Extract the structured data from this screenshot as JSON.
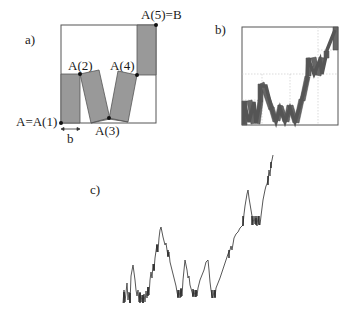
{
  "panels": {
    "a": {
      "tag": "a)",
      "points": {
        "A1": "A=A(1)",
        "A2": "A(2)",
        "A3": "A(3)",
        "A4": "A(4)",
        "A5": "A(5)=B"
      },
      "width_label": "b",
      "rect_fill": "#999999",
      "stroke": "#333333"
    },
    "b": {
      "tag": "b)",
      "rect_fill": "#666666",
      "guide_color": "#bbbbbb"
    },
    "c": {
      "tag": "c)",
      "curve_color": "#444444"
    }
  }
}
